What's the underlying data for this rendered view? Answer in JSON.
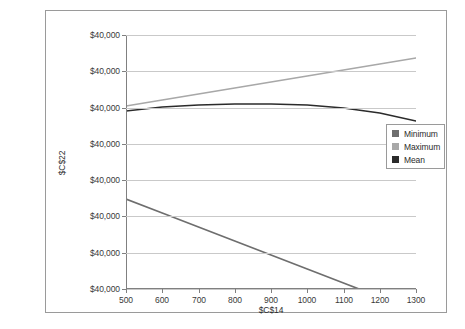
{
  "chart_data": {
    "type": "line",
    "title": "",
    "xlabel": "$C$14",
    "ylabel": "$C$22",
    "x": [
      500,
      600,
      700,
      800,
      900,
      1000,
      1100,
      1200,
      1300
    ],
    "xlim": [
      500,
      1300
    ],
    "xticks": [
      "500",
      "600",
      "700",
      "800",
      "900",
      "1000",
      "1100",
      "1200",
      "1300"
    ],
    "yticks": [
      "$40,000",
      "$40,000",
      "$40,000",
      "$40,000",
      "$40,000",
      "$40,000",
      "$40,000",
      "$40,000"
    ],
    "grid": true,
    "legend_position": "right",
    "series": [
      {
        "name": "Minimum",
        "color": "#6e6e6e",
        "values_px": [
          164,
          178,
          192,
          206,
          220,
          234,
          248,
          262,
          276
        ]
      },
      {
        "name": "Maximum",
        "color": "#a8a8a8",
        "values_px": [
          71,
          65,
          59,
          53,
          47,
          41,
          35,
          29,
          23
        ]
      },
      {
        "name": "Mean",
        "color": "#2b2b2b",
        "values_px": [
          76,
          72,
          70,
          69,
          69,
          70,
          73,
          78,
          86
        ]
      }
    ]
  },
  "legend": {
    "items": [
      {
        "label": "Minimum",
        "color": "#6e6e6e"
      },
      {
        "label": "Maximum",
        "color": "#a8a8a8"
      },
      {
        "label": "Mean",
        "color": "#2b2b2b"
      }
    ]
  }
}
